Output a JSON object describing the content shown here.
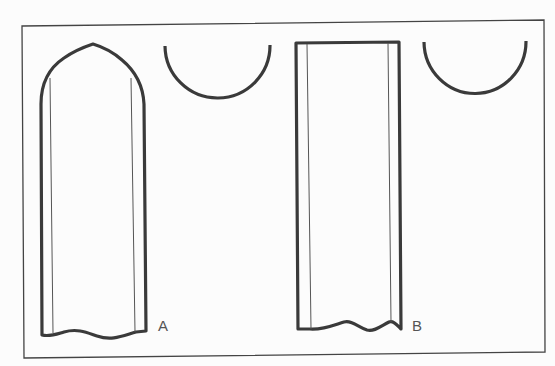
{
  "diagram": {
    "type": "pattern-pieces",
    "colors": {
      "background": "#fcfcfc",
      "stroke_heavy": "#3a3a3a",
      "stroke_thin": "#555555",
      "frame": "#444444",
      "label": "#555555"
    },
    "figures": [
      {
        "id": "A",
        "label": "A",
        "main_piece": "pointed-arch-top strip with wavy bottom edge",
        "detail_piece": "semicircle arc"
      },
      {
        "id": "B",
        "label": "B",
        "main_piece": "rectangular strip with wavy bottom edge",
        "detail_piece": "semicircle arc"
      }
    ]
  }
}
